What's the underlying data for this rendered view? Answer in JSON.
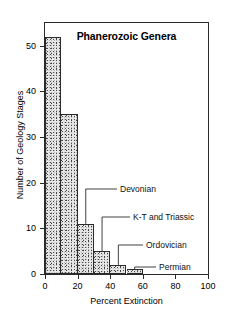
{
  "chart_data": {
    "type": "bar",
    "title": "Phanerozoic Genera",
    "xlabel": "Percent Extinction",
    "ylabel": "Number of Geology Stages",
    "xlim": [
      0,
      100
    ],
    "ylim": [
      0,
      55
    ],
    "grid": false,
    "legend": null,
    "bin_width": 10,
    "categories": [
      "0-10",
      "10-20",
      "20-30",
      "30-40",
      "40-50",
      "50-60"
    ],
    "bin_edges": [
      0,
      10,
      20,
      30,
      40,
      50,
      60
    ],
    "values": [
      52,
      35,
      11,
      5,
      2,
      1
    ],
    "xticks": [
      0,
      20,
      40,
      60,
      80,
      100
    ],
    "xticklabels": [
      "0",
      "20",
      "40",
      "60",
      "80",
      "100"
    ],
    "yticks": [
      0,
      10,
      20,
      30,
      40,
      50
    ],
    "yticklabels": [
      "0",
      "10",
      "20",
      "30",
      "40",
      "50"
    ],
    "annotations": [
      {
        "label": "Devonian",
        "x_percent": 25,
        "y_value": 11
      },
      {
        "label": "K-T and Triassic",
        "x_percent": 35,
        "y_value": 5
      },
      {
        "label": "Ordovician",
        "x_percent": 45,
        "y_value": 2
      },
      {
        "label": "Permian",
        "x_percent": 55,
        "y_value": 1
      }
    ],
    "colors": {
      "bar_fill": "#e8e8e8",
      "bar_edge": "#2b2b2b",
      "axis": "#2a2a2a",
      "text": "#000000"
    }
  },
  "axes": {
    "x": {
      "label": "Percent Extinction",
      "ticklabels": [
        "0",
        "20",
        "40",
        "60",
        "80",
        "100"
      ]
    },
    "y": {
      "label": "Number of Geology Stages",
      "ticklabels": [
        "0",
        "10",
        "20",
        "30",
        "40",
        "50"
      ]
    }
  },
  "title": "Phanerozoic Genera",
  "annotations": {
    "devonian": "Devonian",
    "kt_triassic": "K-T and Triassic",
    "ordovician": "Ordovician",
    "permian": "Permian"
  }
}
